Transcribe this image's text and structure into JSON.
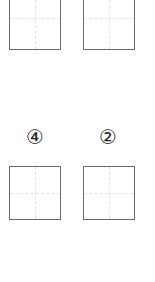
{
  "worksheet": {
    "top_row": {
      "boxes": [
        {
          "position": "left"
        },
        {
          "position": "right"
        }
      ]
    },
    "bottom_row": {
      "labels": [
        {
          "text": "④",
          "value": 4
        },
        {
          "text": "②",
          "value": 2
        }
      ],
      "boxes": [
        {
          "position": "left"
        },
        {
          "position": "right"
        }
      ]
    },
    "colors": {
      "box_border": "#6b6b6b",
      "guide_line": "#e2e2e2",
      "label_text": "#222222",
      "background": "#ffffff"
    }
  }
}
